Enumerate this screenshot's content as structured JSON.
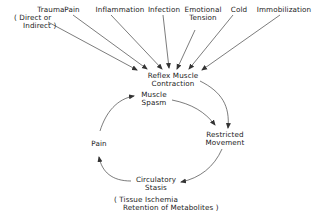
{
  "causes": [
    {
      "label": "Trauma",
      "sub": "( Direct or",
      "sub2": "Indirect )"
    },
    {
      "label": "Pain"
    },
    {
      "label": "Inflammation"
    },
    {
      "label": "Infection"
    },
    {
      "label": "Emotional",
      "sub": "Tension"
    },
    {
      "label": "Cold"
    },
    {
      "label": "Immobilization"
    }
  ],
  "center": {
    "line1": "Reflex  Muscle",
    "line2": "Contraction"
  },
  "cycle": {
    "spasm": {
      "line1": "Muscle",
      "line2": "Spasm"
    },
    "restricted": {
      "line1": "Restricted",
      "line2": "Movement"
    },
    "stasis": {
      "line1": "Circulatory",
      "line2": "Stasis"
    },
    "pain": {
      "label": "Pain"
    }
  },
  "footnote": {
    "line1": "( Tissue  Ischemia",
    "line2": "Retention  of  Metabolites )"
  },
  "colors": {
    "ink": "#222222",
    "background": "#ffffff"
  }
}
